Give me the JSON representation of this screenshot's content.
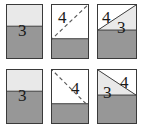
{
  "figure": {
    "colors": {
      "light_gray": "#e9e9e9",
      "dark_gray": "#979797",
      "white": "#ffffff",
      "outline": "#3a3a3a",
      "dash": "#5a5a5a",
      "text": "#1a1a1a"
    },
    "panels": [
      {
        "id": "panel-1",
        "row": 1,
        "column": 1,
        "kind": "flat-sheet",
        "regions": [
          {
            "name": "upper-band",
            "fill": "light_gray",
            "top_fraction": 0.0,
            "bottom_fraction": 0.4
          },
          {
            "name": "lower-band",
            "fill": "dark_gray",
            "top_fraction": 0.4,
            "bottom_fraction": 1.0
          }
        ],
        "dashed_fold_line": null,
        "labels": [
          {
            "text": "3",
            "region": "straddles-band-boundary"
          }
        ]
      },
      {
        "id": "panel-2",
        "row": 1,
        "column": 2,
        "kind": "fold-indicated",
        "regions": [
          {
            "name": "upper-area",
            "fill": "white",
            "top_fraction": 0.0,
            "bottom_fraction": 0.64
          },
          {
            "name": "lower-band",
            "fill": "dark_gray",
            "top_fraction": 0.64,
            "bottom_fraction": 1.0
          }
        ],
        "dashed_fold_line": {
          "from": "bottom-left",
          "to": "top-right"
        },
        "labels": [
          {
            "text": "4",
            "region": "upper-left"
          }
        ]
      },
      {
        "id": "panel-3",
        "row": 1,
        "column": 3,
        "kind": "folded",
        "regions": [
          {
            "name": "upper-left-triangle",
            "fill": "white"
          },
          {
            "name": "upper-right-flap-triangle",
            "fill": "light_gray"
          },
          {
            "name": "lower-area",
            "fill": "dark_gray"
          }
        ],
        "dashed_fold_line": null,
        "labels": [
          {
            "text": "4",
            "region": "upper-left-triangle"
          },
          {
            "text": "3",
            "region": "lower-area"
          }
        ]
      },
      {
        "id": "panel-4",
        "row": 2,
        "column": 1,
        "kind": "flat-sheet",
        "regions": [
          {
            "name": "upper-band",
            "fill": "light_gray",
            "top_fraction": 0.0,
            "bottom_fraction": 0.4
          },
          {
            "name": "lower-band",
            "fill": "dark_gray",
            "top_fraction": 0.4,
            "bottom_fraction": 1.0
          }
        ],
        "dashed_fold_line": null,
        "labels": [
          {
            "text": "3",
            "region": "straddles-band-boundary"
          }
        ]
      },
      {
        "id": "panel-5",
        "row": 2,
        "column": 2,
        "kind": "fold-indicated",
        "regions": [
          {
            "name": "upper-area",
            "fill": "white",
            "top_fraction": 0.0,
            "bottom_fraction": 0.64
          },
          {
            "name": "lower-band",
            "fill": "dark_gray",
            "top_fraction": 0.64,
            "bottom_fraction": 1.0
          }
        ],
        "dashed_fold_line": {
          "from": "top-left",
          "to": "bottom-right"
        },
        "labels": [
          {
            "text": "4",
            "region": "upper-right"
          }
        ]
      },
      {
        "id": "panel-6",
        "row": 2,
        "column": 3,
        "kind": "folded",
        "regions": [
          {
            "name": "upper-right-triangle",
            "fill": "white"
          },
          {
            "name": "upper-left-flap-triangle",
            "fill": "light_gray"
          },
          {
            "name": "lower-area",
            "fill": "dark_gray"
          }
        ],
        "dashed_fold_line": null,
        "labels": [
          {
            "text": "4",
            "region": "upper-right-triangle"
          },
          {
            "text": "3",
            "region": "lower-area"
          }
        ]
      }
    ],
    "label_values": {
      "three": "3",
      "four": "4"
    }
  }
}
